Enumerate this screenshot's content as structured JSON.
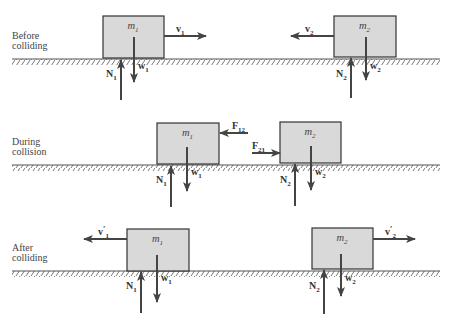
{
  "colors": {
    "box_fill": "#d9d9d9",
    "box_stroke": "#333333",
    "arrow": "#444444",
    "ground": "#555555",
    "text": "#333333"
  },
  "stages": [
    {
      "id": "before",
      "label_line1": "Before",
      "label_line2": "colliding",
      "ground_y": 59,
      "blocks": [
        {
          "mass": "m",
          "mass_sub": "1",
          "box": {
            "x": 103,
            "y": 16,
            "w": 61,
            "h": 42
          },
          "velocity": {
            "name": "v",
            "sub": "1",
            "prime": "",
            "from_x": 164,
            "to_x": 206,
            "y": 36
          },
          "normal": {
            "name": "N",
            "sub": "1",
            "x": 121,
            "from_y": 100,
            "to_y": 60
          },
          "weight": {
            "name": "w",
            "sub": "1",
            "x": 134,
            "from_y": 37,
            "to_y": 82
          }
        },
        {
          "mass": "m",
          "mass_sub": "2",
          "box": {
            "x": 334,
            "y": 16,
            "w": 62,
            "h": 41
          },
          "velocity": {
            "name": "v",
            "sub": "2",
            "prime": "",
            "from_x": 334,
            "to_x": 291,
            "y": 36
          },
          "normal": {
            "name": "N",
            "sub": "2",
            "x": 351,
            "from_y": 98,
            "to_y": 58
          },
          "weight": {
            "name": "w",
            "sub": "2",
            "x": 366,
            "from_y": 37,
            "to_y": 80
          }
        }
      ]
    },
    {
      "id": "during",
      "label_line1": "During",
      "label_line2": "collision",
      "ground_y": 165,
      "blocks": [
        {
          "mass": "m",
          "mass_sub": "1",
          "box": {
            "x": 157,
            "y": 123,
            "w": 62,
            "h": 41
          },
          "force": {
            "name": "F",
            "sub": "12",
            "from_x": 248,
            "to_x": 220,
            "y": 133
          },
          "normal": {
            "name": "N",
            "sub": "1",
            "x": 171,
            "from_y": 207,
            "to_y": 166
          },
          "weight": {
            "name": "w",
            "sub": "1",
            "x": 187,
            "from_y": 147,
            "to_y": 191
          }
        },
        {
          "mass": "m",
          "mass_sub": "2",
          "box": {
            "x": 280,
            "y": 122,
            "w": 61,
            "h": 41
          },
          "force": {
            "name": "F",
            "sub": "21",
            "from_x": 252,
            "to_x": 280,
            "y": 153
          },
          "normal": {
            "name": "N",
            "sub": "2",
            "x": 295,
            "from_y": 206,
            "to_y": 164
          },
          "weight": {
            "name": "w",
            "sub": "2",
            "x": 311,
            "from_y": 146,
            "to_y": 190
          }
        }
      ]
    },
    {
      "id": "after",
      "label_line1": "After",
      "label_line2": "colliding",
      "ground_y": 271,
      "blocks": [
        {
          "mass": "m",
          "mass_sub": "1",
          "box": {
            "x": 127,
            "y": 229,
            "w": 62,
            "h": 42
          },
          "velocity": {
            "name": "v",
            "sub": "1",
            "prime": "′",
            "from_x": 127,
            "to_x": 84,
            "y": 239
          },
          "normal": {
            "name": "N",
            "sub": "1",
            "x": 141,
            "from_y": 313,
            "to_y": 272
          },
          "weight": {
            "name": "w",
            "sub": "1",
            "x": 157,
            "from_y": 255,
            "to_y": 302
          }
        },
        {
          "mass": "m",
          "mass_sub": "2",
          "box": {
            "x": 312,
            "y": 228,
            "w": 61,
            "h": 41
          },
          "velocity": {
            "name": "v",
            "sub": "2",
            "prime": "′",
            "from_x": 373,
            "to_x": 415,
            "y": 239
          },
          "normal": {
            "name": "N",
            "sub": "2",
            "x": 324,
            "from_y": 314,
            "to_y": 270
          },
          "weight": {
            "name": "w",
            "sub": "2",
            "x": 341,
            "from_y": 254,
            "to_y": 296
          }
        }
      ]
    }
  ]
}
